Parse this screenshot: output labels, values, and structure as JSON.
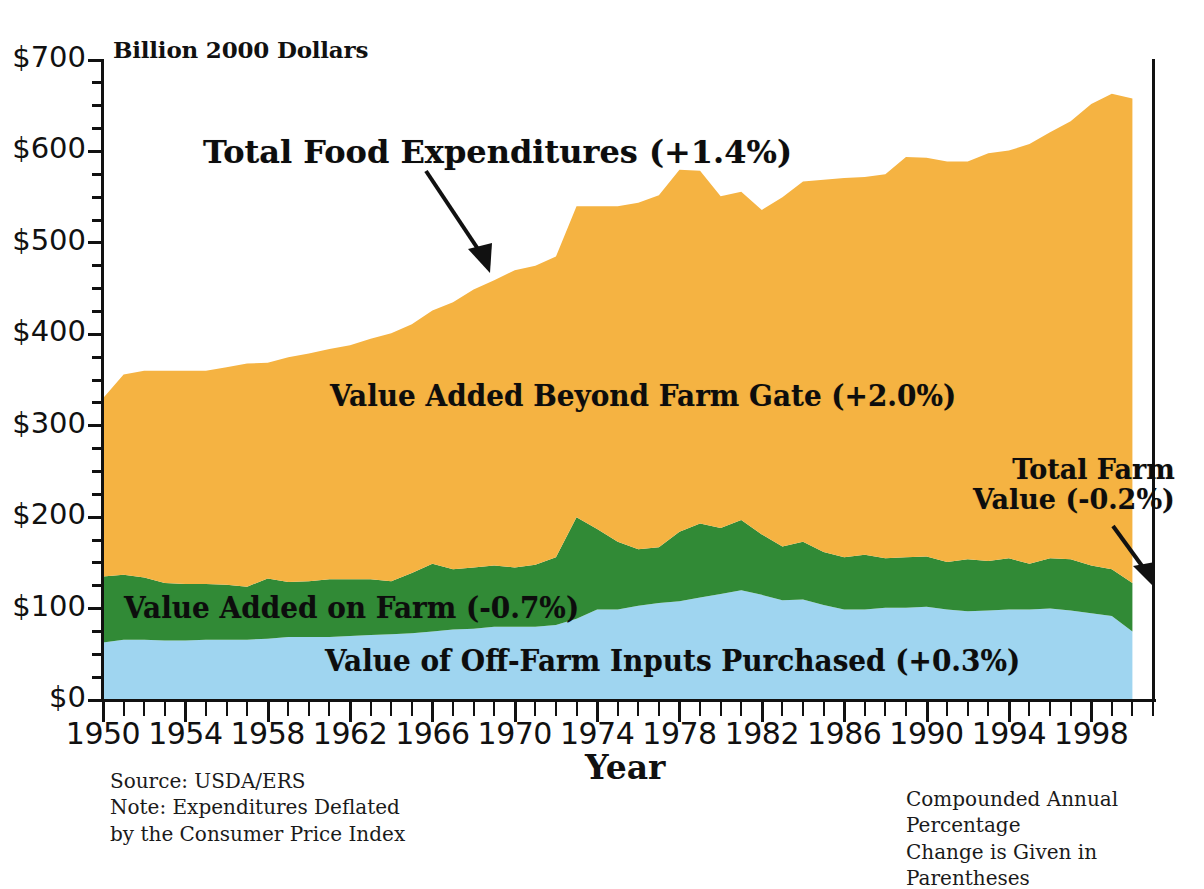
{
  "figure": {
    "unit_title": "Billion 2000 Dollars",
    "x_axis_title": "Year",
    "source_note": "Source: USDA/ERS\nNote: Expenditures Deflated\nby the Consumer Price Index",
    "right_note": "Compounded Annual Percentage\nChange is Given in Parentheses"
  },
  "labels": {
    "total_food": "Total Food Expenditures (+1.4%)",
    "beyond_gate": "Value Added Beyond Farm Gate (+2.0%)",
    "total_farm_value": "Total Farm\nValue (-0.2%)",
    "on_farm": "Value Added on Farm (-0.7%)",
    "off_farm": "Value of Off-Farm Inputs Purchased (+0.3%)"
  },
  "colors": {
    "off_farm_inputs": "#9fd5f0",
    "value_added_on_farm": "#318a36",
    "value_added_beyond_farm_gate": "#f5b342",
    "axis": "#111111",
    "background": "#ffffff"
  },
  "chart_data": {
    "type": "area",
    "stacked": true,
    "title": "",
    "subtitle": "",
    "xlabel": "Year",
    "ylabel": "Billion 2000 Dollars",
    "xlim": [
      1950,
      2001
    ],
    "ylim": [
      0,
      700
    ],
    "ytick_labels": [
      "$0",
      "$100",
      "$200",
      "$300",
      "$400",
      "$500",
      "$600",
      "$700"
    ],
    "ytick_values": [
      0,
      100,
      200,
      300,
      400,
      500,
      600,
      700
    ],
    "yminor_step": 25,
    "xtick_labels": [
      "1950",
      "1954",
      "1958",
      "1962",
      "1966",
      "1970",
      "1974",
      "1978",
      "1982",
      "1986",
      "1990",
      "1994",
      "1998"
    ],
    "xtick_values": [
      1950,
      1954,
      1958,
      1962,
      1966,
      1970,
      1974,
      1978,
      1982,
      1986,
      1990,
      1994,
      1998
    ],
    "xminor_step": 1,
    "grid": false,
    "legend_position": "inline-annotations",
    "x": [
      1950,
      1951,
      1952,
      1953,
      1954,
      1955,
      1956,
      1957,
      1958,
      1959,
      1960,
      1961,
      1962,
      1963,
      1964,
      1965,
      1966,
      1967,
      1968,
      1969,
      1970,
      1971,
      1972,
      1973,
      1974,
      1975,
      1976,
      1977,
      1978,
      1979,
      1980,
      1981,
      1982,
      1983,
      1984,
      1985,
      1986,
      1987,
      1988,
      1989,
      1990,
      1991,
      1992,
      1993,
      1994,
      1995,
      1996,
      1997,
      1998,
      1999,
      2000
    ],
    "series": [
      {
        "name": "Value of Off-Farm Inputs Purchased (+0.3%)",
        "color": "#9fd5f0",
        "annual_pct_change": 0.3,
        "values": [
          63,
          66,
          66,
          65,
          65,
          66,
          66,
          66,
          67,
          69,
          69,
          69,
          70,
          71,
          72,
          73,
          75,
          77,
          78,
          80,
          80,
          80,
          82,
          89,
          99,
          99,
          103,
          106,
          108,
          112,
          116,
          120,
          115,
          109,
          110,
          104,
          99,
          99,
          101,
          101,
          102,
          99,
          97,
          98,
          99,
          99,
          100,
          98,
          95,
          92,
          75
        ]
      },
      {
        "name": "Value Added on Farm (-0.7%)",
        "color": "#318a36",
        "annual_pct_change": -0.7,
        "values": [
          72,
          71,
          68,
          63,
          62,
          61,
          60,
          58,
          66,
          60,
          61,
          63,
          62,
          61,
          58,
          66,
          74,
          66,
          67,
          67,
          65,
          68,
          74,
          111,
          88,
          74,
          62,
          61,
          76,
          81,
          72,
          77,
          66,
          59,
          63,
          58,
          57,
          60,
          54,
          55,
          55,
          52,
          57,
          54,
          56,
          50,
          55,
          56,
          52,
          51,
          53
        ]
      },
      {
        "name": "Value Added Beyond Farm Gate (+2.0%)",
        "color": "#f5b342",
        "annual_pct_change": 2.0,
        "values": [
          195,
          219,
          226,
          232,
          233,
          233,
          238,
          244,
          236,
          246,
          249,
          252,
          256,
          263,
          271,
          272,
          277,
          292,
          304,
          312,
          325,
          327,
          329,
          340,
          353,
          367,
          379,
          385,
          396,
          386,
          363,
          359,
          355,
          382,
          394,
          407,
          415,
          413,
          420,
          438,
          436,
          438,
          435,
          446,
          446,
          459,
          466,
          479,
          505,
          520,
          530
        ]
      }
    ],
    "totals": {
      "name": "Total Food Expenditures (+1.4%)",
      "annual_pct_change": 1.4,
      "values": [
        330,
        356,
        360,
        360,
        360,
        360,
        364,
        368,
        369,
        375,
        379,
        384,
        388,
        395,
        401,
        411,
        426,
        435,
        449,
        459,
        470,
        475,
        485,
        540,
        540,
        540,
        544,
        552,
        580,
        579,
        551,
        556,
        536,
        550,
        567,
        569,
        571,
        572,
        575,
        594,
        593,
        589,
        589,
        598,
        601,
        608,
        621,
        633,
        652,
        663,
        658
      ]
    },
    "farm_value": {
      "name": "Total Farm Value (-0.2%)",
      "annual_pct_change": -0.2,
      "description": "Sum of off-farm inputs purchased and value added on farm (top of green band)",
      "values": [
        135,
        137,
        134,
        128,
        127,
        127,
        126,
        124,
        133,
        129,
        130,
        132,
        132,
        132,
        130,
        139,
        149,
        143,
        145,
        147,
        145,
        148,
        156,
        200,
        187,
        173,
        165,
        167,
        184,
        193,
        188,
        197,
        181,
        168,
        173,
        162,
        156,
        159,
        155,
        156,
        157,
        151,
        154,
        152,
        155,
        149,
        155,
        154,
        147,
        143,
        128
      ]
    }
  }
}
